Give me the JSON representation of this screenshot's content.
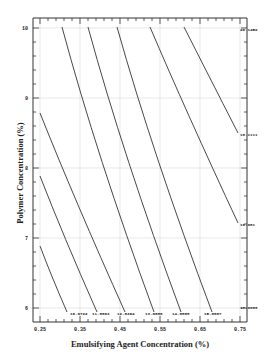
{
  "chart_data": {
    "type": "contour",
    "title": "",
    "xlabel": "Emulsifying Agent Concentration (%)",
    "ylabel": "Polymer Concentration (%)",
    "xlim": [
      0.25,
      0.75
    ],
    "ylim": [
      6,
      10
    ],
    "x_ticks": [
      "0.25",
      "0.35",
      "0.45",
      "0.55",
      "0.65",
      "0.75"
    ],
    "x_tick_values": [
      0.25,
      0.35,
      0.45,
      0.55,
      0.65,
      0.75
    ],
    "y_ticks": [
      "6",
      "7",
      "8",
      "9",
      "10"
    ],
    "y_tick_values": [
      6,
      7,
      8,
      9,
      10
    ],
    "grid": true,
    "contour_levels": [
      {
        "label": "10.9722",
        "x_bottom": 0.32,
        "y_top": 7.2
      },
      {
        "label": "11.8863",
        "x_bottom": 0.38,
        "y_top": 8.2
      },
      {
        "label": "12.8304",
        "x_bottom": 0.44,
        "y_top": 9.25
      },
      {
        "label": "13.8888",
        "x_bottom": 0.51,
        "y_top": 10.0
      },
      {
        "label": "14.8888",
        "x_bottom": 0.59,
        "y_top": 10.0
      },
      {
        "label": "15.8887",
        "x_bottom": 0.68,
        "y_top": 10.0
      },
      {
        "label": "16.981",
        "x_right": 0.75,
        "y_right": 7.0
      },
      {
        "label": "17.9888",
        "x_right": 0.75,
        "y_right": 6.05
      },
      {
        "label": "18.1111",
        "x_right": 0.75,
        "y_right": 8.45
      },
      {
        "label": "20.1452",
        "x_right": 0.75,
        "y_right": 10.0
      }
    ]
  },
  "labels": {
    "x_axis": "Emulsifying Agent Concentration (%)",
    "y_axis": "Polymer Concentration (%)"
  }
}
